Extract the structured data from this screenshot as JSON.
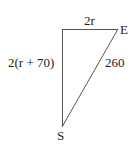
{
  "diagram": {
    "vertices": {
      "top_right": "E",
      "bottom": "S"
    },
    "edges": {
      "top": "2r",
      "left": "2(r + 70)",
      "hypotenuse": "260"
    },
    "colors": {
      "line": "#555555",
      "text": "#222222",
      "background": "#ffffff"
    }
  }
}
